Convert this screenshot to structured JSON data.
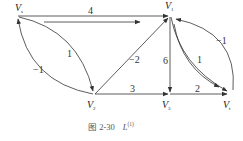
{
  "diagram": {
    "nodes": [
      {
        "id": "Vs",
        "label": "V",
        "sub": "s"
      },
      {
        "id": "V1",
        "label": "V",
        "sub": "1"
      },
      {
        "id": "V2",
        "label": "V",
        "sub": "2"
      },
      {
        "id": "V3",
        "label": "V",
        "sub": "3"
      },
      {
        "id": "Vt",
        "label": "V",
        "sub": "t"
      }
    ],
    "edges": [
      {
        "from": "Vs",
        "to": "V1",
        "weight": "4"
      },
      {
        "from": "Vs",
        "to": "V2",
        "weight": "1"
      },
      {
        "from": "V2",
        "to": "Vs",
        "weight": "−1"
      },
      {
        "from": "V2",
        "to": "V1",
        "weight": "−2"
      },
      {
        "from": "V2",
        "to": "V3",
        "weight": "3"
      },
      {
        "from": "V1",
        "to": "V3",
        "weight": "6"
      },
      {
        "from": "V3",
        "to": "Vt",
        "weight": "2"
      },
      {
        "from": "V1",
        "to": "Vt",
        "weight": "1"
      },
      {
        "from": "Vt",
        "to": "V1",
        "weight": "−1"
      }
    ],
    "caption": {
      "fig": "图 2-30",
      "label": "L",
      "sup": "(1)"
    }
  }
}
